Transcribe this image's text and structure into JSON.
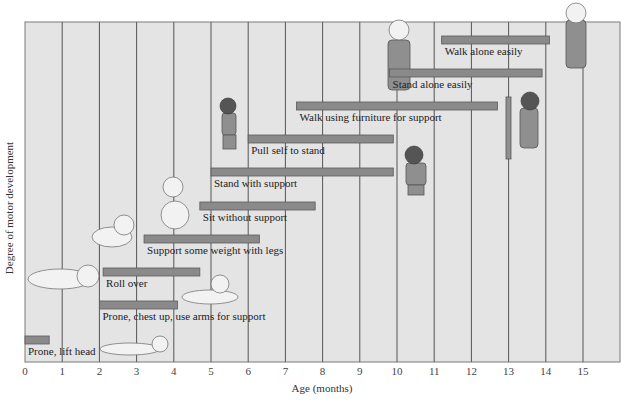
{
  "chart_data": {
    "type": "bar",
    "orientation": "horizontal-range",
    "title": "",
    "xlabel": "Age (months)",
    "ylabel": "Degree of motor development",
    "xlim": [
      0,
      16
    ],
    "x_ticks": [
      0,
      1,
      2,
      3,
      4,
      5,
      6,
      7,
      8,
      9,
      10,
      11,
      12,
      13,
      14,
      15
    ],
    "grid": "vertical lines at each month",
    "legend": null,
    "categories": [
      "Prone, lift head",
      "Prone, chest up, use arms for support",
      "Roll over",
      "Support some weight with legs",
      "Sit without support",
      "Stand with support",
      "Pull self to stand",
      "Walk using furniture for support",
      "Stand alone easily",
      "Walk alone easily"
    ],
    "series": [
      {
        "name": "Age range (months)",
        "start": [
          0.0,
          2.0,
          2.1,
          3.2,
          4.7,
          5.0,
          6.0,
          7.3,
          9.8,
          11.2
        ],
        "end": [
          0.65,
          4.1,
          4.7,
          6.3,
          7.8,
          9.9,
          9.9,
          12.7,
          13.9,
          14.1
        ]
      }
    ],
    "annotations": "Line illustrations of infants next to milestones"
  },
  "axes": {
    "x_title": "Age (months)",
    "y_title": "Degree of motor development",
    "ticks": [
      "0",
      "1",
      "2",
      "3",
      "4",
      "5",
      "6",
      "7",
      "8",
      "9",
      "10",
      "11",
      "12",
      "13",
      "14",
      "15"
    ]
  },
  "milestones": [
    {
      "label": "Prone, lift head"
    },
    {
      "label": "Prone, chest up, use arms for support"
    },
    {
      "label": "Roll over"
    },
    {
      "label": "Support some weight with legs"
    },
    {
      "label": "Sit without support"
    },
    {
      "label": "Stand with support"
    },
    {
      "label": "Pull self to stand"
    },
    {
      "label": "Walk using furniture for support"
    },
    {
      "label": "Stand alone easily"
    },
    {
      "label": "Walk alone easily"
    }
  ],
  "colors": {
    "plot_background": "#e4e4e4",
    "bar_fill": "#8a8a8a",
    "gridline": "#555555"
  }
}
